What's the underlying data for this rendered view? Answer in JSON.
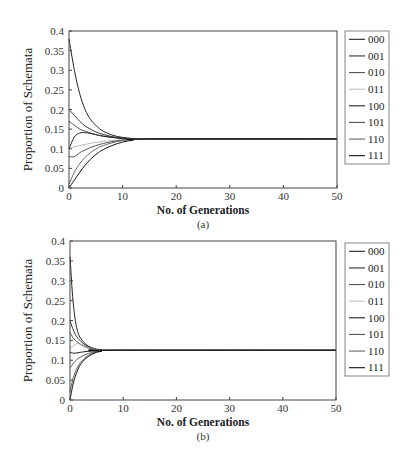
{
  "chart_data": [
    {
      "type": "line",
      "caption": "(a)",
      "title": "",
      "xlabel": "No. of Generations",
      "ylabel": "Proportion of Schemata",
      "xlim": [
        0,
        50
      ],
      "ylim": [
        0,
        0.4
      ],
      "xticks": [
        0,
        10,
        20,
        30,
        40,
        50
      ],
      "yticks": [
        0,
        0.05,
        0.1,
        0.15,
        0.2,
        0.25,
        0.3,
        0.35,
        0.4
      ],
      "ytick_labels": [
        "0",
        "0.05",
        "0.1",
        "0.15",
        "0.2",
        "0.25",
        "0.3",
        "0.35",
        "0.4"
      ],
      "grid": false,
      "legend_position": "outside-right",
      "converge_value": 0.125,
      "converge_by_generation": 14,
      "series": [
        {
          "name": "000",
          "x": [
            0,
            1,
            2,
            3,
            4,
            5,
            6,
            8,
            10,
            12,
            14,
            50
          ],
          "values": [
            0.38,
            0.3,
            0.24,
            0.2,
            0.175,
            0.16,
            0.148,
            0.135,
            0.129,
            0.126,
            0.125,
            0.125
          ]
        },
        {
          "name": "001",
          "x": [
            0,
            1,
            2,
            3,
            4,
            5,
            6,
            8,
            10,
            12,
            14,
            50
          ],
          "values": [
            0.2,
            0.185,
            0.17,
            0.158,
            0.15,
            0.143,
            0.138,
            0.131,
            0.127,
            0.126,
            0.125,
            0.125
          ]
        },
        {
          "name": "010",
          "x": [
            0,
            1,
            2,
            3,
            4,
            5,
            6,
            8,
            10,
            12,
            14,
            50
          ],
          "values": [
            0.17,
            0.16,
            0.15,
            0.145,
            0.14,
            0.136,
            0.133,
            0.129,
            0.126,
            0.125,
            0.125,
            0.125
          ]
        },
        {
          "name": "011",
          "x": [
            0,
            1,
            2,
            3,
            4,
            5,
            6,
            8,
            10,
            12,
            14,
            50
          ],
          "values": [
            0.1,
            0.105,
            0.108,
            0.111,
            0.114,
            0.116,
            0.118,
            0.121,
            0.123,
            0.124,
            0.125,
            0.125
          ]
        },
        {
          "name": "100",
          "x": [
            0,
            1,
            2,
            3,
            4,
            5,
            6,
            8,
            10,
            12,
            14,
            50
          ],
          "values": [
            0.1,
            0.13,
            0.14,
            0.141,
            0.139,
            0.136,
            0.133,
            0.129,
            0.126,
            0.125,
            0.125,
            0.125
          ]
        },
        {
          "name": "101",
          "x": [
            0,
            1,
            2,
            3,
            4,
            5,
            6,
            8,
            10,
            12,
            14,
            50
          ],
          "values": [
            0.08,
            0.08,
            0.09,
            0.097,
            0.103,
            0.108,
            0.112,
            0.118,
            0.122,
            0.124,
            0.125,
            0.125
          ]
        },
        {
          "name": "110",
          "x": [
            0,
            1,
            2,
            3,
            4,
            5,
            6,
            8,
            10,
            12,
            14,
            50
          ],
          "values": [
            0.01,
            0.04,
            0.062,
            0.078,
            0.09,
            0.099,
            0.106,
            0.115,
            0.121,
            0.124,
            0.125,
            0.125
          ]
        },
        {
          "name": "111",
          "x": [
            0,
            1,
            2,
            3,
            4,
            5,
            6,
            8,
            10,
            12,
            14,
            50
          ],
          "values": [
            0.0,
            0.02,
            0.04,
            0.058,
            0.073,
            0.085,
            0.095,
            0.108,
            0.117,
            0.122,
            0.125,
            0.125
          ]
        }
      ]
    },
    {
      "type": "line",
      "caption": "(b)",
      "title": "",
      "xlabel": "No. of Generations",
      "ylabel": "Proportion of Schemata",
      "xlim": [
        0,
        50
      ],
      "ylim": [
        0,
        0.4
      ],
      "xticks": [
        0,
        10,
        20,
        30,
        40,
        50
      ],
      "yticks": [
        0,
        0.05,
        0.1,
        0.15,
        0.2,
        0.25,
        0.3,
        0.35,
        0.4
      ],
      "ytick_labels": [
        "0",
        "0.05",
        "0.1",
        "0.15",
        "0.2",
        "0.25",
        "0.3",
        "0.35",
        "0.4"
      ],
      "grid": false,
      "legend_position": "outside-right",
      "converge_value": 0.125,
      "converge_by_generation": 7,
      "series": [
        {
          "name": "000",
          "x": [
            0,
            0.5,
            1,
            1.5,
            2,
            3,
            4,
            5,
            6,
            7,
            50
          ],
          "values": [
            0.36,
            0.26,
            0.2,
            0.17,
            0.155,
            0.14,
            0.132,
            0.128,
            0.126,
            0.125,
            0.125
          ]
        },
        {
          "name": "001",
          "x": [
            0,
            0.5,
            1,
            1.5,
            2,
            3,
            4,
            5,
            6,
            7,
            50
          ],
          "values": [
            0.2,
            0.18,
            0.165,
            0.155,
            0.148,
            0.137,
            0.131,
            0.127,
            0.126,
            0.125,
            0.125
          ]
        },
        {
          "name": "010",
          "x": [
            0,
            0.5,
            1,
            1.5,
            2,
            3,
            4,
            5,
            6,
            7,
            50
          ],
          "values": [
            0.17,
            0.158,
            0.15,
            0.145,
            0.14,
            0.133,
            0.129,
            0.127,
            0.125,
            0.125,
            0.125
          ]
        },
        {
          "name": "011",
          "x": [
            0,
            0.5,
            1,
            1.5,
            2,
            3,
            4,
            5,
            6,
            7,
            50
          ],
          "values": [
            0.13,
            0.135,
            0.14,
            0.142,
            0.14,
            0.135,
            0.13,
            0.127,
            0.126,
            0.125,
            0.125
          ]
        },
        {
          "name": "100",
          "x": [
            0,
            0.5,
            1,
            1.5,
            2,
            3,
            4,
            5,
            6,
            7,
            50
          ],
          "values": [
            0.12,
            0.118,
            0.118,
            0.119,
            0.12,
            0.122,
            0.123,
            0.124,
            0.125,
            0.125,
            0.125
          ]
        },
        {
          "name": "101",
          "x": [
            0,
            0.5,
            1,
            1.5,
            2,
            3,
            4,
            5,
            6,
            7,
            50
          ],
          "values": [
            0.08,
            0.09,
            0.098,
            0.104,
            0.108,
            0.115,
            0.119,
            0.122,
            0.124,
            0.125,
            0.125
          ]
        },
        {
          "name": "110",
          "x": [
            0,
            0.5,
            1,
            1.5,
            2,
            3,
            4,
            5,
            6,
            7,
            50
          ],
          "values": [
            0.02,
            0.05,
            0.07,
            0.085,
            0.095,
            0.108,
            0.116,
            0.121,
            0.123,
            0.125,
            0.125
          ]
        },
        {
          "name": "111",
          "x": [
            0,
            0.5,
            1,
            1.5,
            2,
            3,
            4,
            5,
            6,
            7,
            50
          ],
          "values": [
            0.0,
            0.035,
            0.06,
            0.077,
            0.09,
            0.105,
            0.114,
            0.12,
            0.123,
            0.125,
            0.125
          ]
        }
      ]
    }
  ],
  "legend": {
    "entries": [
      "000",
      "001",
      "010",
      "011",
      "100",
      "101",
      "110",
      "111"
    ],
    "line_colors": [
      "#222222",
      "#333333",
      "#555555",
      "#999999",
      "#222222",
      "#555555",
      "#666666",
      "#111111"
    ]
  },
  "colors": {
    "axis": "#444444",
    "series_palette": [
      "#222222",
      "#333333",
      "#555555",
      "#999999",
      "#222222",
      "#555555",
      "#666666",
      "#111111"
    ]
  }
}
